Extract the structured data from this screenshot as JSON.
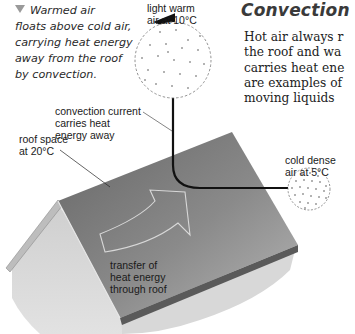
{
  "caption": {
    "lines": [
      "Warmed air",
      "floats above cold air,",
      "carrying heat energy",
      "away from the roof",
      "by convection."
    ]
  },
  "section": {
    "title": "Convection",
    "body_lines": [
      "Hot air always r",
      "the roof and wa",
      "carries heat ene",
      "are examples of",
      "moving liquids"
    ]
  },
  "labels": {
    "light_warm_air": [
      "light warm",
      "air at 10°C"
    ],
    "cold_dense_air": [
      "cold dense",
      "air at 5°C"
    ],
    "convection_current": [
      "convection current",
      "carries heat",
      "energy away"
    ],
    "roof_space": [
      "roof space",
      "at 20°C"
    ],
    "heat_transfer": [
      "transfer of",
      "heat energy",
      "through roof"
    ]
  },
  "colors": {
    "roof_dark": "#6e6e6e",
    "roof_light": "#a9a9a9",
    "wall": "#d6d6d6",
    "arrow": "#111111"
  }
}
